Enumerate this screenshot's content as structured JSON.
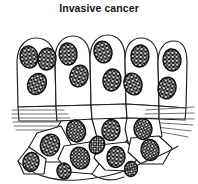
{
  "figure": {
    "title": "Invasive cancer",
    "kind": "histology-line-drawing",
    "caption_position": "top-center",
    "background_color": "#ffffff",
    "ink_color": "#1a1a1a"
  },
  "diagram": {
    "subject": "Invasive cancer",
    "layers": [
      {
        "name": "epithelium",
        "label": "atypical epithelial cell layer",
        "cell_count": 9,
        "cell_shape": "columnar to polygonal, rounded apical borders",
        "nuclei_per_cell": "1-3",
        "nucleus_appearance": "large dark oval with light stippled chromatin"
      },
      {
        "name": "basement-membrane",
        "label": "basement membrane",
        "render": "parallel horizontal hatch lines",
        "line_count": 6,
        "state": "breached in the centre",
        "left_segment_x": [
          12,
          74
        ],
        "right_segment_x": [
          140,
          192
        ],
        "y_center": 107
      },
      {
        "name": "stroma-invasion",
        "label": "invading tumour cells in stroma",
        "cell_count": 8,
        "cell_shape": "irregular angular polygonal",
        "note": "cells have crossed the basement membrane"
      }
    ],
    "nuclei_total": 22,
    "palette": {
      "outline": "#1a1a1a",
      "nucleus_dark": "#111111",
      "chromatin_light": "#f2f2f2",
      "membrane_line": "#4a4a4a",
      "cytoplasm": "#ffffff"
    }
  }
}
